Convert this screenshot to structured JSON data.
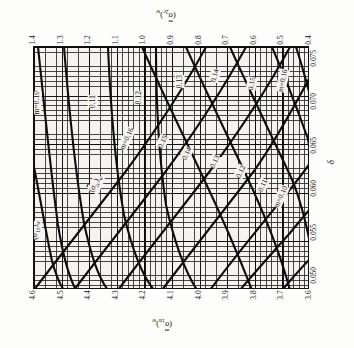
{
  "figure": {
    "kind": "engineering-nomograph",
    "orientation_note": "printed sideways (rotated 90 deg)",
    "background": "#f4f3f0",
    "frame_color": "#111111"
  },
  "axes": {
    "top": {
      "title_plain": "(sigma_2c)_w",
      "ticks": [
        "1.4",
        "1.3",
        "1.2",
        "1.1",
        "1.0",
        "0.9",
        "0.8",
        "0.7",
        "0.6",
        "0.5",
        "0.4"
      ]
    },
    "bottom": {
      "title_plain": "(sigma_1n)_w",
      "ticks": [
        "4.6",
        "4.5",
        "4.4",
        "4.3",
        "4.2",
        "4.1",
        "4.0",
        "3.9",
        "3.8",
        "3.7",
        "3.6"
      ]
    },
    "right": {
      "title_plain": "delta",
      "title_glyph": "δ",
      "ticks": [
        "0.050",
        "0.055",
        "0.060",
        "0.065",
        "0.070",
        "0.075"
      ]
    }
  },
  "family_labels": [
    {
      "id": "family-sigma-1n",
      "text_plain": "(sigma_1n)_w"
    },
    {
      "id": "family-sigma-2c",
      "text_plain": "(sigma_2c)_w"
    }
  ],
  "curve_labels": {
    "upper_band": [
      "m=0.10",
      "0.11",
      "0.12",
      "0.13",
      "0.14",
      "0.15",
      "m=0.16"
    ],
    "mid_band": [
      "m=0.16",
      "0.15",
      "0.14",
      "0.13",
      "0.12",
      "0.11",
      "m=0.10"
    ]
  },
  "chart_data": {
    "type": "line",
    "title": "",
    "subtitle": "",
    "xlabel": "δ",
    "ylabel": "(σ̈1n)w  /  (σ̈2c)w",
    "grid": "on",
    "legend": "inline-curve-labels",
    "xlim": [
      0.05,
      0.078
    ],
    "x_ticks": [
      0.05,
      0.055,
      0.06,
      0.065,
      0.07,
      0.075
    ],
    "axis_sigma_1n": {
      "range": [
        3.6,
        4.6
      ],
      "ticks": [
        4.6,
        4.5,
        4.4,
        4.3,
        4.2,
        4.1,
        4.0,
        3.9,
        3.8,
        3.7,
        3.6
      ]
    },
    "axis_sigma_2c": {
      "range": [
        0.4,
        1.4
      ],
      "ticks": [
        1.4,
        1.3,
        1.2,
        1.1,
        1.0,
        0.9,
        0.8,
        0.7,
        0.6,
        0.5,
        0.4
      ]
    },
    "parameter": {
      "name": "m",
      "values": [
        0.1,
        0.11,
        0.12,
        0.13,
        0.14,
        0.15,
        0.16
      ]
    },
    "series": [
      {
        "name": "(σ̈1n)w m=0.10",
        "family": "sigma_1n",
        "m": 0.1,
        "x": [
          0.05,
          0.056,
          0.062,
          0.068,
          0.074,
          0.078
        ],
        "values": [
          4.6,
          4.55,
          4.5,
          4.44,
          4.38,
          4.34
        ]
      },
      {
        "name": "(σ̈1n)w m=0.11",
        "family": "sigma_1n",
        "m": 0.11,
        "x": [
          0.05,
          0.056,
          0.062,
          0.068,
          0.074,
          0.078
        ],
        "values": [
          4.5,
          4.46,
          4.41,
          4.36,
          4.31,
          4.27
        ]
      },
      {
        "name": "(σ̈1n)w m=0.12",
        "family": "sigma_1n",
        "m": 0.12,
        "x": [
          0.05,
          0.056,
          0.062,
          0.068,
          0.074,
          0.078
        ],
        "values": [
          4.36,
          4.31,
          4.26,
          4.21,
          4.16,
          4.12
        ]
      },
      {
        "name": "(σ̈1n)w m=0.13",
        "family": "sigma_1n",
        "m": 0.13,
        "x": [
          0.05,
          0.056,
          0.062,
          0.068,
          0.074,
          0.078
        ],
        "values": [
          4.22,
          4.17,
          4.12,
          4.07,
          4.02,
          3.98
        ]
      },
      {
        "name": "(σ̈1n)w m=0.14",
        "family": "sigma_1n",
        "m": 0.14,
        "x": [
          0.05,
          0.056,
          0.062,
          0.068,
          0.074,
          0.078
        ],
        "values": [
          4.08,
          4.03,
          3.98,
          3.93,
          3.88,
          3.84
        ]
      },
      {
        "name": "(σ̈1n)w m=0.15",
        "family": "sigma_1n",
        "m": 0.15,
        "x": [
          0.05,
          0.056,
          0.062,
          0.068,
          0.074,
          0.078
        ],
        "values": [
          3.94,
          3.89,
          3.84,
          3.79,
          3.74,
          3.7
        ]
      },
      {
        "name": "(σ̈1n)w m=0.16",
        "family": "sigma_1n",
        "m": 0.16,
        "x": [
          0.05,
          0.056,
          0.062,
          0.068,
          0.074,
          0.078
        ],
        "values": [
          3.8,
          3.75,
          3.7,
          3.66,
          3.62,
          3.6
        ]
      },
      {
        "name": "(σ̈2c)w m=0.10",
        "family": "sigma_2c",
        "m": 0.1,
        "x": [
          0.05,
          0.056,
          0.062,
          0.068,
          0.074,
          0.078
        ],
        "values": [
          0.52,
          0.58,
          0.64,
          0.71,
          0.78,
          0.83
        ]
      },
      {
        "name": "(σ̈2c)w m=0.11",
        "family": "sigma_2c",
        "m": 0.11,
        "x": [
          0.05,
          0.056,
          0.062,
          0.068,
          0.074,
          0.078
        ],
        "values": [
          0.6,
          0.67,
          0.74,
          0.81,
          0.88,
          0.93
        ]
      },
      {
        "name": "(σ̈2c)w m=0.12",
        "family": "sigma_2c",
        "m": 0.12,
        "x": [
          0.05,
          0.056,
          0.062,
          0.068,
          0.074,
          0.078
        ],
        "values": [
          0.69,
          0.76,
          0.83,
          0.91,
          0.98,
          1.03
        ]
      },
      {
        "name": "(σ̈2c)w m=0.13",
        "family": "sigma_2c",
        "m": 0.13,
        "x": [
          0.05,
          0.056,
          0.062,
          0.068,
          0.074,
          0.078
        ],
        "values": [
          0.78,
          0.85,
          0.93,
          1.0,
          1.08,
          1.13
        ]
      },
      {
        "name": "(σ̈2c)w m=0.14",
        "family": "sigma_2c",
        "m": 0.14,
        "x": [
          0.05,
          0.056,
          0.062,
          0.068,
          0.074,
          0.078
        ],
        "values": [
          0.87,
          0.95,
          1.02,
          1.1,
          1.18,
          1.23
        ]
      },
      {
        "name": "(σ̈2c)w m=0.15",
        "family": "sigma_2c",
        "m": 0.15,
        "x": [
          0.05,
          0.056,
          0.062,
          0.068,
          0.074,
          0.078
        ],
        "values": [
          0.96,
          1.04,
          1.12,
          1.2,
          1.28,
          1.33
        ]
      },
      {
        "name": "(σ̈2c)w m=0.16",
        "family": "sigma_2c",
        "m": 0.16,
        "x": [
          0.05,
          0.056,
          0.062,
          0.068,
          0.074,
          0.078
        ],
        "values": [
          1.06,
          1.14,
          1.22,
          1.3,
          1.38,
          1.4
        ]
      }
    ]
  }
}
